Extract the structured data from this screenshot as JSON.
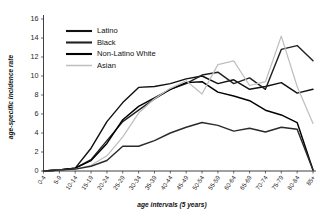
{
  "figure": {
    "background_color": "#ffffff",
    "width": 322,
    "height": 219
  },
  "axes": {
    "y_title": "age-specific incidence rate",
    "x_title": "age intervals (5 years)"
  },
  "legend": {
    "position": "upper-left-inside",
    "entries": [
      {
        "label": "Latino",
        "color": "#111111"
      },
      {
        "label": "Black",
        "color": "#222222"
      },
      {
        "label": "Non-Latino White",
        "color": "#000000"
      },
      {
        "label": "Asian",
        "color": "#bfbfbf"
      }
    ]
  },
  "chart_data": {
    "type": "line",
    "title": "",
    "subtitle": "",
    "xlabel": "age intervals (5 years)",
    "ylabel": "age-specific incidence rate",
    "grid": false,
    "legend_position": "upper left",
    "ylim": [
      0,
      16
    ],
    "yticks": [
      0,
      2,
      4,
      6,
      8,
      10,
      12,
      14,
      16
    ],
    "categories": [
      "0-4",
      "5-9",
      "10-14",
      "15-19",
      "20-24",
      "25-29",
      "30-34",
      "35-39",
      "40-44",
      "45-49",
      "50-54",
      "55-59",
      "60-64",
      "65-69",
      "70-74",
      "75-79",
      "80-84",
      "85+"
    ],
    "series": [
      {
        "name": "Latino",
        "color": "#111111",
        "values": [
          0.0,
          0.1,
          0.3,
          2.4,
          5.2,
          7.2,
          8.8,
          8.9,
          9.2,
          9.7,
          10.0,
          9.2,
          9.6,
          8.6,
          8.9,
          9.3,
          8.2,
          8.6
        ]
      },
      {
        "name": "Black",
        "color": "#222222",
        "values": [
          0.0,
          0.1,
          0.3,
          1.2,
          3.2,
          5.2,
          6.4,
          7.6,
          8.6,
          9.2,
          10.1,
          10.4,
          9.2,
          9.8,
          8.6,
          12.8,
          13.2,
          11.6
        ]
      },
      {
        "name": "Non-Latino White",
        "color": "#000000",
        "values": [
          0.0,
          0.1,
          0.3,
          1.1,
          2.9,
          5.4,
          6.8,
          7.7,
          8.6,
          9.3,
          9.4,
          8.3,
          7.9,
          7.4,
          6.4,
          5.9,
          5.1,
          0.1
        ]
      },
      {
        "name": "Asian",
        "color": "#bfbfbf",
        "values": [
          0.0,
          0.1,
          0.2,
          0.6,
          1.6,
          3.6,
          6.1,
          7.6,
          8.7,
          9.5,
          8.1,
          11.2,
          11.6,
          9.0,
          9.4,
          14.2,
          8.9,
          5.0
        ]
      },
      {
        "name": "lower-curve",
        "color": "#2a2a2a",
        "values": [
          0.0,
          0.1,
          0.2,
          0.5,
          1.1,
          2.6,
          2.6,
          3.2,
          4.0,
          4.6,
          5.1,
          4.8,
          4.2,
          4.5,
          4.1,
          4.6,
          4.4,
          0.1
        ]
      }
    ]
  }
}
